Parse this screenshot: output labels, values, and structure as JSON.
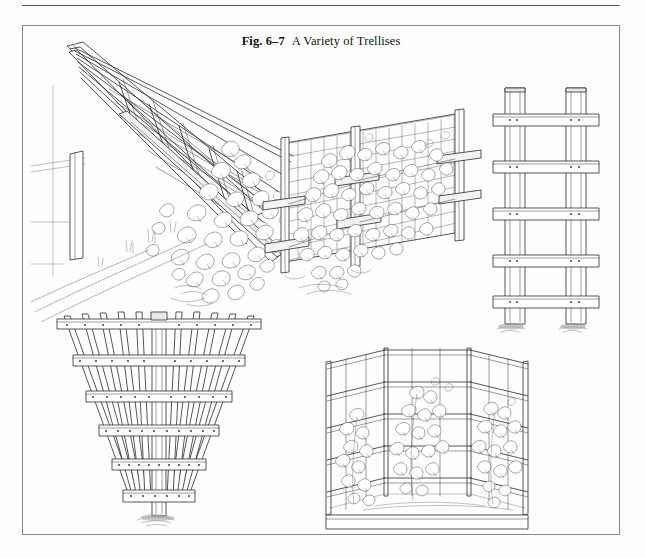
{
  "page": {
    "background_color": "#fefefe",
    "width": 645,
    "height": 558
  },
  "top_rule": {
    "name": "horizontal-rule",
    "color": "#5a5a5a"
  },
  "figure": {
    "frame_color": "#8a8a8a",
    "caption": {
      "number": "Fig. 6–7",
      "title": "A Variety of Trellises",
      "full": "Fig. 6–7   A Variety of Trellises"
    },
    "illustrations": [
      {
        "id": "lean-to-arbor-trellis",
        "label": "Lean-to arbor trellis against wall with climbing vines",
        "position": "upper-left"
      },
      {
        "id": "wire-mesh-fence-trellis",
        "label": "Wire mesh fence trellis on posts with crossarms and vines",
        "position": "upper-center"
      },
      {
        "id": "ladder-rail-trellis",
        "label": "Two-post ladder trellis with five horizontal rails",
        "position": "upper-right"
      },
      {
        "id": "fan-post-trellis",
        "label": "Fan-shaped trellis on single center post",
        "position": "lower-left"
      },
      {
        "id": "corner-screen-trellis",
        "label": "Three-panel corner screen trellis with planted vines",
        "position": "lower-center"
      }
    ]
  },
  "colors": {
    "ink": "#2b2b2b",
    "paper": "#fefefe",
    "frame": "#8a8a8a",
    "rule": "#5a5a5a"
  }
}
